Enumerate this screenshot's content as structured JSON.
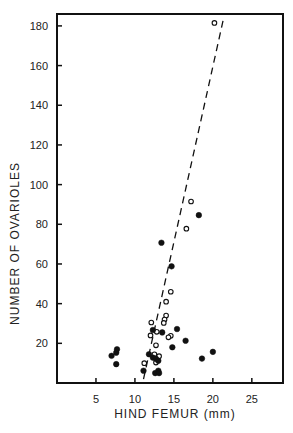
{
  "chart_data": {
    "type": "scatter",
    "title": "",
    "xlabel": "HIND FEMUR (mm)",
    "ylabel": "NUMBER OF OVARIOLES",
    "xlim": [
      0,
      29
    ],
    "ylim": [
      0,
      186
    ],
    "x_ticks": [
      5,
      10,
      15,
      20,
      25
    ],
    "x_tick_labels": [
      "5",
      "10",
      "15",
      "20",
      "25"
    ],
    "y_ticks": [
      20,
      40,
      60,
      80,
      100,
      120,
      140,
      160,
      180
    ],
    "y_tick_labels": [
      "20",
      "40",
      "60",
      "80",
      "100",
      "120",
      "140",
      "160",
      "180"
    ],
    "grid": false,
    "legend": null,
    "series": [
      {
        "name": "open circles",
        "marker": "open-circle",
        "color": "#111111",
        "points": [
          [
            20.2,
            181.5
          ],
          [
            17.2,
            91.5
          ],
          [
            16.6,
            77.8
          ],
          [
            14.6,
            46
          ],
          [
            14.0,
            41
          ],
          [
            14.0,
            34
          ],
          [
            13.8,
            32
          ],
          [
            13.7,
            30.3
          ],
          [
            12.1,
            30.5
          ],
          [
            12.8,
            25.8
          ],
          [
            12.0,
            24
          ],
          [
            14.6,
            23.8
          ],
          [
            14.3,
            23
          ],
          [
            12.7,
            19
          ],
          [
            12.5,
            14.5
          ],
          [
            13.1,
            13.5
          ],
          [
            12.7,
            10.3
          ],
          [
            11.2,
            10
          ]
        ]
      },
      {
        "name": "filled circles",
        "marker": "filled-circle",
        "color": "#111111",
        "points": [
          [
            18.2,
            84.6
          ],
          [
            13.4,
            70.7
          ],
          [
            14.7,
            58.8
          ],
          [
            12.3,
            26.7
          ],
          [
            13.5,
            25.5
          ],
          [
            15.4,
            27.2
          ],
          [
            16.5,
            21.3
          ],
          [
            14.8,
            18
          ],
          [
            20.0,
            15.7
          ],
          [
            18.6,
            12.3
          ],
          [
            7.0,
            13.7
          ],
          [
            7.6,
            15.3
          ],
          [
            7.7,
            17
          ],
          [
            7.6,
            9.5
          ],
          [
            11.8,
            14.5
          ],
          [
            12.3,
            12.8
          ],
          [
            12.7,
            12.2
          ],
          [
            13.0,
            11.2
          ],
          [
            11.1,
            6.2
          ],
          [
            12.6,
            5
          ],
          [
            13.0,
            6.2
          ],
          [
            13.1,
            5
          ]
        ]
      }
    ],
    "fit_line": {
      "style": "dashed",
      "from": [
        11.1,
        2
      ],
      "to": [
        21.3,
        182.5
      ]
    }
  }
}
